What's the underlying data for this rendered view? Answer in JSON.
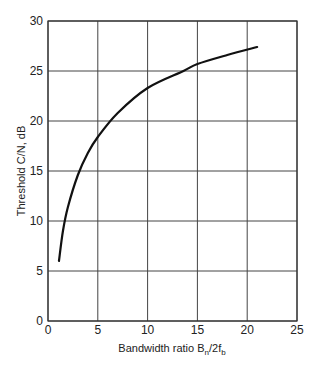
{
  "chart_data": {
    "type": "line",
    "title": "",
    "xlabel": "Bandwidth ratio B_n/2f_b",
    "xlabel_parts": {
      "main": "Bandwidth ratio B",
      "sub1": "n",
      "mid": "/2f",
      "sub2": "b"
    },
    "ylabel": "Threshold C/N, dB",
    "xlim": [
      0,
      25
    ],
    "ylim": [
      0,
      30
    ],
    "xticks": [
      0,
      5,
      10,
      15,
      20,
      25
    ],
    "yticks": [
      0,
      5,
      10,
      15,
      20,
      25,
      30
    ],
    "grid": true,
    "legend": null,
    "series": [
      {
        "name": "Threshold C/N",
        "color": "#111111",
        "x": [
          1.1,
          1.5,
          2,
          3,
          4,
          5,
          7,
          10,
          13.6,
          15,
          18,
          21
        ],
        "y": [
          6.0,
          9.0,
          11.4,
          14.6,
          16.8,
          18.4,
          20.8,
          23.3,
          25.0,
          25.7,
          26.6,
          27.4
        ]
      }
    ]
  }
}
